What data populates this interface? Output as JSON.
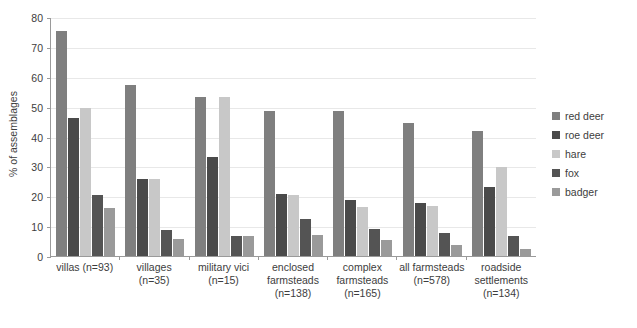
{
  "chart_data": {
    "type": "bar",
    "title": "",
    "xlabel": "",
    "ylabel": "% of assemblages",
    "ylim": [
      0,
      80
    ],
    "ytick_step": 10,
    "yticks": [
      80,
      70,
      60,
      50,
      40,
      30,
      20,
      10,
      0
    ],
    "grid": true,
    "legend_position": "right",
    "categories": [
      "villas (n=93)",
      "villages (n=35)",
      "military vici (n=15)",
      "enclosed farmsteads (n=138)",
      "complex farmsteads (n=165)",
      "all farmsteads (n=578)",
      "roadside settlements (n=134)"
    ],
    "category_lines": [
      [
        "villas (n=93)"
      ],
      [
        "villages (n=35)"
      ],
      [
        "military vici",
        "(n=15)"
      ],
      [
        "enclosed",
        "farmsteads",
        "(n=138)"
      ],
      [
        "complex",
        "farmsteads",
        "(n=165)"
      ],
      [
        "all farmsteads",
        "(n=578)"
      ],
      [
        "roadside",
        "settlements",
        "(n=134)"
      ]
    ],
    "series": [
      {
        "name": "red deer",
        "color": "#7f7f7f",
        "values": [
          75.3,
          57.1,
          53.3,
          48.6,
          48.5,
          44.6,
          41.8
        ]
      },
      {
        "name": "roe deer",
        "color": "#4a4a4a",
        "values": [
          46.2,
          25.7,
          33.3,
          20.8,
          18.8,
          17.9,
          23.1
        ]
      },
      {
        "name": "hare",
        "color": "#c8c8c8",
        "values": [
          49.5,
          25.7,
          53.3,
          20.3,
          16.4,
          16.8,
          29.9
        ]
      },
      {
        "name": "fox",
        "color": "#545454",
        "values": [
          20.4,
          8.6,
          6.7,
          12.3,
          9.1,
          7.6,
          6.7
        ]
      },
      {
        "name": "badger",
        "color": "#9a9a9a",
        "values": [
          16.1,
          5.7,
          6.7,
          7.2,
          5.5,
          3.8,
          2.2
        ]
      }
    ]
  }
}
